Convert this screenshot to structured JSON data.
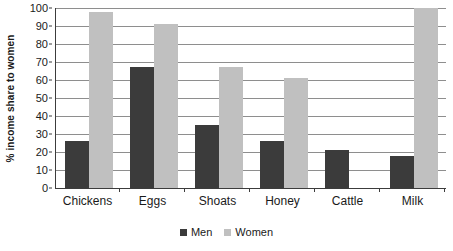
{
  "chart_data": {
    "type": "bar",
    "title": "",
    "subtitle": "",
    "xlabel": "",
    "ylabel": "% income share to women",
    "ylim": [
      0,
      100
    ],
    "ytick_step": 10,
    "yticks": [
      100,
      90,
      80,
      70,
      60,
      50,
      40,
      30,
      20,
      10,
      0
    ],
    "grid": true,
    "grid_axis": "y",
    "legend_position": "bottom-center",
    "categories": [
      "Chickens",
      "Eggs",
      "Shoats",
      "Honey",
      "Cattle",
      "Milk"
    ],
    "series": [
      {
        "name": "Men",
        "color": "#3b3b3b",
        "values": [
          26,
          67,
          35,
          26,
          21,
          18
        ]
      },
      {
        "name": "Women",
        "color": "#c0c0c0",
        "values": [
          98,
          91,
          67,
          61,
          0,
          100
        ]
      }
    ]
  },
  "axis": {
    "y_title": "% income share to women",
    "y_tick_labels": [
      "100",
      "90",
      "80",
      "70",
      "60",
      "50",
      "40",
      "30",
      "20",
      "10",
      "0"
    ],
    "x_tick_labels": [
      "Chickens",
      "Eggs",
      "Shoats",
      "Honey",
      "Cattle",
      "Milk"
    ]
  },
  "legend": {
    "items": [
      {
        "label": "Men",
        "color": "#3b3b3b"
      },
      {
        "label": "Women",
        "color": "#c0c0c0"
      }
    ]
  },
  "colors": {
    "men": "#3b3b3b",
    "women": "#c0c0c0",
    "axis": "#3c3c3c",
    "gridline": "#8e8e8e",
    "text": "#1a1a1a",
    "background": "#ffffff"
  }
}
